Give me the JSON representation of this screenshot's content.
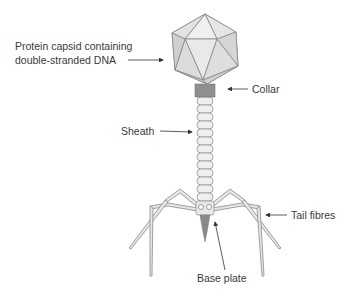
{
  "diagram": {
    "labels": {
      "capsid_line1": "Protein capsid containing",
      "capsid_line2": "double-stranded DNA",
      "collar": "Collar",
      "sheath": "Sheath",
      "tail_fibres": "Tail fibres",
      "base_plate": "Base plate"
    },
    "colors": {
      "capsid_fill": "#dcdcdc",
      "capsid_stroke": "#8a8a8a",
      "collar_fill": "#8c8c8c",
      "sheath_fill": "#ececec",
      "fibre_fill": "#e4e4e4",
      "spike_fill": "#8a8a8a",
      "text": "#3a3a3a"
    }
  }
}
